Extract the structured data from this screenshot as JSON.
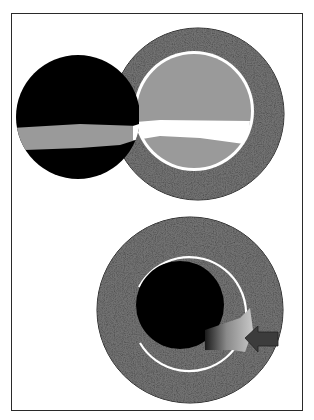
{
  "figure": {
    "colors": {
      "background": "#ffffff",
      "frame": "#2a2a2a",
      "textured_ring": "#4a4a4a",
      "inner_gray": "#9a9a9a",
      "white_ring": "#ffffff",
      "black_mass": "#000000",
      "arrow": "#3c3c3c"
    },
    "panels": [
      {
        "id": "top-panel",
        "elements": [
          {
            "name": "outer-textured-ring",
            "cx": 198,
            "cy": 114,
            "r": 86
          },
          {
            "name": "inner-gray-lumen",
            "cx": 194,
            "cy": 111,
            "r": 58
          },
          {
            "name": "black-sphere",
            "cx": 78,
            "cy": 117,
            "r": 62
          },
          {
            "name": "gray-band",
            "y_top": 128,
            "y_bottom": 150
          },
          {
            "name": "white-band",
            "y_top": 120,
            "y_bottom": 145
          }
        ]
      },
      {
        "id": "bottom-panel",
        "elements": [
          {
            "name": "outer-textured-ring",
            "cx": 190,
            "cy": 310,
            "r": 93
          },
          {
            "name": "white-arc-ring",
            "cx": 188,
            "cy": 310,
            "r": 58,
            "gap_side": "left"
          },
          {
            "name": "black-lumen",
            "cx": 180,
            "cy": 305,
            "r": 43
          },
          {
            "name": "gradient-wedge"
          },
          {
            "name": "left-pointing-arrow"
          }
        ]
      }
    ]
  }
}
